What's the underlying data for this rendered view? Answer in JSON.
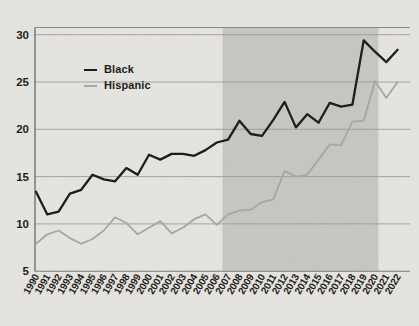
{
  "chart_data": {
    "type": "line",
    "x": [
      1990,
      1991,
      1992,
      1993,
      1994,
      1995,
      1996,
      1997,
      1998,
      1999,
      2000,
      2001,
      2002,
      2003,
      2004,
      2005,
      2006,
      2007,
      2008,
      2009,
      2010,
      2011,
      2012,
      2013,
      2014,
      2015,
      2016,
      2017,
      2018,
      2019,
      2020,
      2021,
      2022
    ],
    "series": [
      {
        "name": "Black",
        "values": [
          13.4,
          11.0,
          11.3,
          13.2,
          13.6,
          15.2,
          14.7,
          14.5,
          15.9,
          15.2,
          17.3,
          16.8,
          17.4,
          17.4,
          17.2,
          17.8,
          18.6,
          18.9,
          20.9,
          19.5,
          19.3,
          21.0,
          22.9,
          20.2,
          21.6,
          20.7,
          22.8,
          22.4,
          22.6,
          29.4,
          28.2,
          27.1,
          28.4
        ]
      },
      {
        "name": "Hispanic",
        "values": [
          7.9,
          8.9,
          9.3,
          8.5,
          7.9,
          8.4,
          9.3,
          10.7,
          10.1,
          8.9,
          9.6,
          10.3,
          9.0,
          9.6,
          10.5,
          11.0,
          9.9,
          11.0,
          11.4,
          11.5,
          12.3,
          12.6,
          15.6,
          15.0,
          15.2,
          16.8,
          18.4,
          18.3,
          20.8,
          20.9,
          25.1,
          23.3,
          25.0
        ]
      }
    ],
    "yticks": [
      30,
      25,
      20,
      15,
      10,
      5
    ],
    "ylim": [
      5,
      31
    ],
    "x_range": [
      1990,
      2022
    ],
    "grid": "horizontal",
    "legend_position": "upper-left-inside",
    "shaded_region": {
      "start_year": 2006.5,
      "end_year": 2020.3
    },
    "colors": {
      "black_series": "#1b1b1a",
      "hispanic_series": "#a8a7a3",
      "background": "#e7e5e1",
      "shaded_region": "#c9c7c2",
      "gridline": "#9e9c96",
      "bottom_axis": "#7f7d77",
      "top_spine": "#8b8984",
      "left_spine": "#55534e",
      "tick_text": "#1d1c1a"
    }
  }
}
